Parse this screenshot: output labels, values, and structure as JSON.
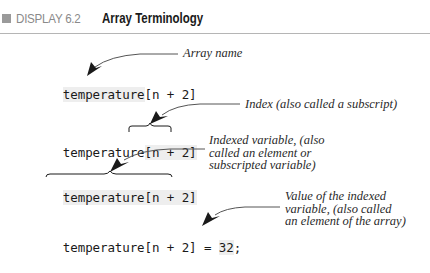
{
  "header": {
    "display_number": "DISPLAY 6.2",
    "title": "Array Terminology"
  },
  "rows": [
    {
      "code_prefix": "temperature",
      "code_index": "[n + 2]",
      "code_suffix": "",
      "label_lines": [
        "Array name"
      ],
      "points_to": "array-name"
    },
    {
      "code_prefix": "temperature",
      "code_index": "[n + 2]",
      "code_suffix": "",
      "label_lines": [
        "Index (also called a subscript)"
      ],
      "points_to": "index"
    },
    {
      "code_prefix": "temperature",
      "code_index": "[n + 2]",
      "code_suffix": "",
      "label_lines": [
        "Indexed variable, (also",
        "called an element or",
        "subscripted variable)"
      ],
      "points_to": "indexed-variable"
    },
    {
      "code_prefix": "temperature",
      "code_index": "[n + 2]",
      "code_assign": " = ",
      "code_value": "32",
      "code_suffix": ";",
      "label_lines": [
        "Value of the indexed",
        "variable, (also called",
        "an element of the array)"
      ],
      "points_to": "value"
    }
  ],
  "colors": {
    "header_square": "#9a9a9a",
    "header_display_text": "#8a8a8a",
    "rule": "#b5b5b5",
    "code_highlight": "#eeeeee",
    "arrow": "#1a1a1a",
    "leader_line": "#555555"
  }
}
